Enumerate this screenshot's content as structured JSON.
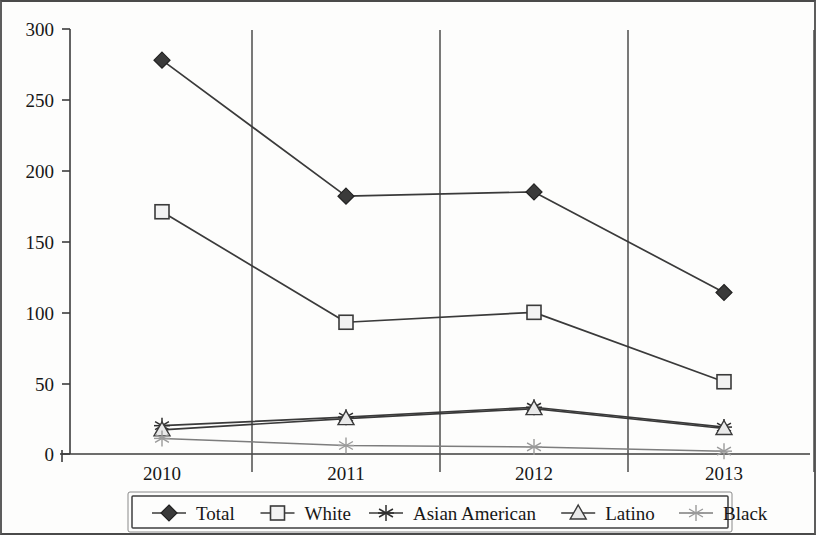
{
  "chart_data": {
    "type": "line",
    "title": "",
    "subtitle": "",
    "xlabel": "",
    "ylabel": "",
    "categories": [
      "2010",
      "2011",
      "2012",
      "2013"
    ],
    "ylim": [
      0,
      300
    ],
    "yticks": [
      0,
      50,
      100,
      150,
      200,
      250,
      300
    ],
    "ytick_labels": [
      "0",
      "50",
      "100",
      "150",
      "200",
      "250",
      "300"
    ],
    "grid": "vertical-category-separators",
    "legend_position": "bottom",
    "series": [
      {
        "name": "Total",
        "marker": "filled-diamond",
        "values": [
          278,
          182,
          185,
          114
        ]
      },
      {
        "name": "White",
        "marker": "open-square",
        "values": [
          171,
          93,
          100,
          51
        ]
      },
      {
        "name": "Asian American",
        "marker": "asterisk",
        "values": [
          20,
          26,
          33,
          19
        ]
      },
      {
        "name": "Latino",
        "marker": "triangle",
        "values": [
          17,
          25,
          32,
          18
        ]
      },
      {
        "name": "Black",
        "marker": "light-asterisk",
        "values": [
          11,
          6,
          5,
          2
        ]
      }
    ]
  },
  "axes": {
    "y_tick_labels": [
      "300",
      "250",
      "200",
      "150",
      "100",
      "50",
      "0"
    ],
    "x_tick_labels": [
      "2010",
      "2011",
      "2012",
      "2013"
    ]
  },
  "legend": {
    "items": [
      {
        "label": "Total",
        "marker": "filled-diamond"
      },
      {
        "label": "White",
        "marker": "open-square"
      },
      {
        "label": "Asian American",
        "marker": "asterisk"
      },
      {
        "label": "Latino",
        "marker": "triangle"
      },
      {
        "label": "Black",
        "marker": "light-asterisk"
      }
    ]
  },
  "colors": {
    "ink": "#3a3a3a",
    "faint_ink": "#8f8f8f",
    "paper": "#fdfdfc"
  }
}
